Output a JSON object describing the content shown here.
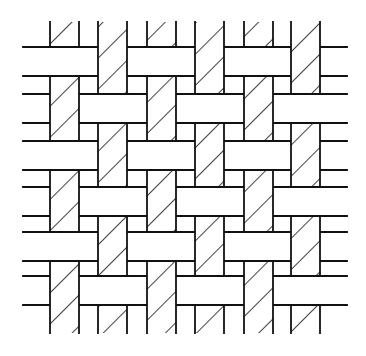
{
  "diagram": {
    "title": "Plain weave pattern",
    "type": "woven-fabric-illustration",
    "colors": {
      "background": "#ffffff",
      "stroke": "#111111",
      "fill": "#ffffff"
    },
    "stroke_width": 1.8,
    "hatch": {
      "spacing": 22,
      "angle_deg": 45
    },
    "extent": {
      "line_x_start": 23,
      "line_x_end": 347,
      "strip_y_start": 22,
      "strip_y_end": 333
    },
    "warp_strips": {
      "label": "hatched vertical strips",
      "width": 29,
      "x": [
        50,
        98,
        147,
        195,
        244,
        291
      ]
    },
    "weft_bands": {
      "label": "plain horizontal bands",
      "height": 29,
      "y": [
        47,
        94,
        141,
        187,
        232,
        276
      ]
    },
    "interlacing": {
      "rule": "weft over when (row+col) even",
      "grid": [
        [
          "H",
          "V",
          "H",
          "V",
          "H",
          "V"
        ],
        [
          "V",
          "H",
          "V",
          "H",
          "V",
          "H"
        ],
        [
          "H",
          "V",
          "H",
          "V",
          "H",
          "V"
        ],
        [
          "V",
          "H",
          "V",
          "H",
          "V",
          "H"
        ],
        [
          "H",
          "V",
          "H",
          "V",
          "H",
          "V"
        ],
        [
          "V",
          "H",
          "V",
          "H",
          "V",
          "H"
        ]
      ]
    }
  }
}
